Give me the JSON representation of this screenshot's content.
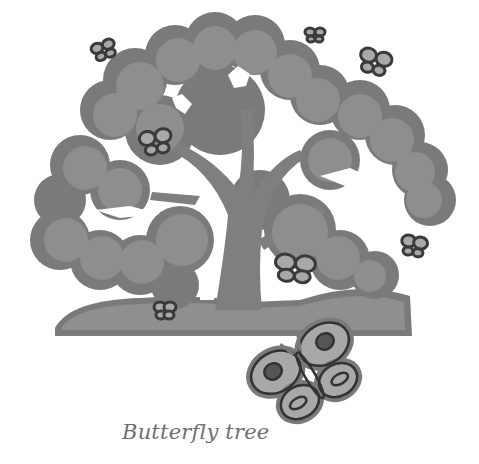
{
  "illustration": {
    "subject": "tree with butterflies",
    "caption": "Butterfly tree",
    "butterfly_count": 9
  },
  "colors": {
    "background": "#ffffff",
    "outline": "#7a7a7a",
    "foliage": "#8c8c8c",
    "trunk": "#808080",
    "butterfly_fill": "#a8a8a8",
    "butterfly_outline": "#3a3a3a",
    "caption": "#6e6e6e"
  }
}
